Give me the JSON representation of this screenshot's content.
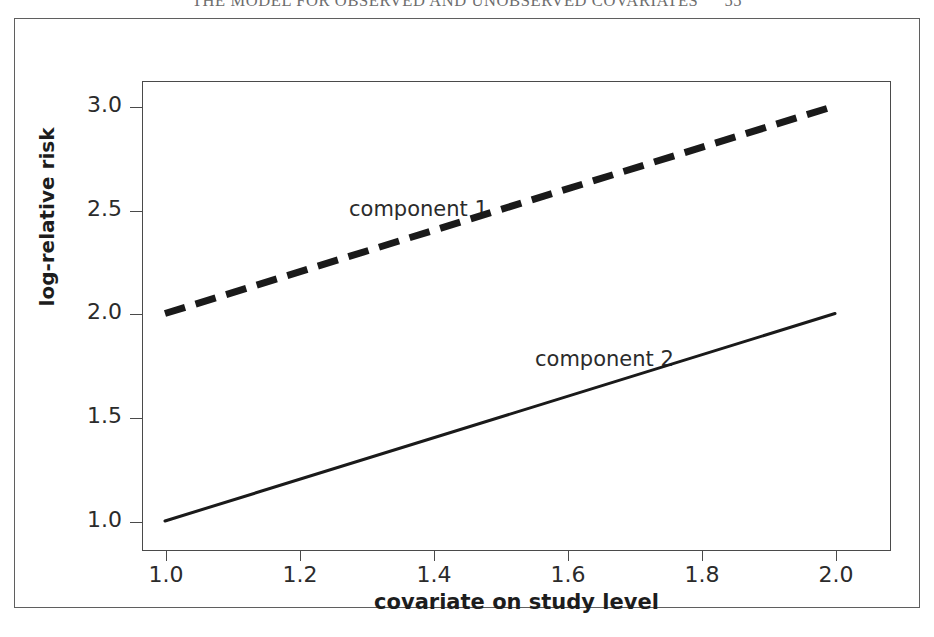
{
  "page_header": {
    "text": "THE MODEL FOR OBSERVED AND UNOBSERVED COVARIATES",
    "page_number": "55"
  },
  "chart_data": {
    "type": "line",
    "title": "",
    "subtitle": "",
    "xlabel": "covariate on study level",
    "ylabel": "log-relative risk",
    "xlim": [
      0.95,
      2.05
    ],
    "ylim": [
      0.87,
      3.1
    ],
    "xticks": [
      "1.0",
      "1.2",
      "1.4",
      "1.6",
      "1.8",
      "2.0"
    ],
    "xtick_values": [
      1.0,
      1.2,
      1.4,
      1.6,
      1.8,
      2.0
    ],
    "yticks": [
      "1.0",
      "1.5",
      "2.0",
      "2.5",
      "3.0"
    ],
    "ytick_values": [
      1.0,
      1.5,
      2.0,
      2.5,
      3.0
    ],
    "grid": false,
    "legend_position": "in-plot annotations",
    "series": [
      {
        "name": "component 1",
        "style": "dashed",
        "linewidth": 7,
        "color": "#1a1a1a",
        "x": [
          1.0,
          2.0
        ],
        "values": [
          2.0,
          3.0
        ],
        "annotation": "component 1"
      },
      {
        "name": "component 2",
        "style": "solid",
        "linewidth": 3,
        "color": "#1a1a1a",
        "x": [
          1.0,
          2.0
        ],
        "values": [
          1.0,
          2.0
        ],
        "annotation": "component 2"
      }
    ]
  }
}
